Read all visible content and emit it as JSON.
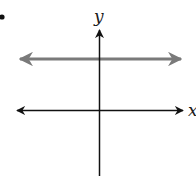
{
  "diagram": {
    "bullet": "•",
    "axes": {
      "x_label": "x",
      "y_label": "y",
      "color": "#111111"
    },
    "horizontal_line": {
      "description": "horizontal line above the x-axis (y = positive constant), arrows on both ends",
      "color": "#7a7a7a"
    }
  }
}
